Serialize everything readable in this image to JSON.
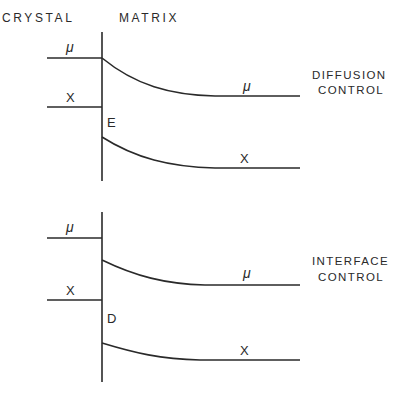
{
  "header": {
    "left": "CRYSTAL",
    "right": "MATRIX"
  },
  "panels": [
    {
      "id": "diffusion",
      "title_line1": "DIFFUSION",
      "title_line2": "CONTROL",
      "crystal_labels": {
        "mu": "μ",
        "x": "X"
      },
      "matrix_labels": {
        "mu": "μ",
        "x": "X"
      },
      "interface_marker": "E"
    },
    {
      "id": "interface",
      "title_line1": "INTERFACE",
      "title_line2": "CONTROL",
      "crystal_labels": {
        "mu": "μ",
        "x": "X"
      },
      "matrix_labels": {
        "mu": "μ",
        "x": "X"
      },
      "interface_marker": "D"
    }
  ],
  "colors": {
    "ink": "#2a2a2a",
    "background": "#ffffff"
  }
}
